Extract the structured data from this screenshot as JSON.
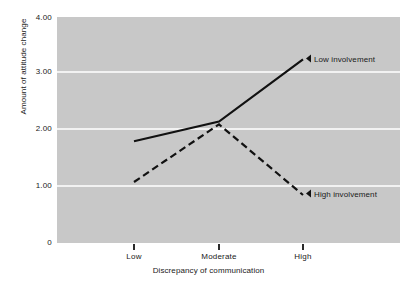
{
  "chart_data": {
    "type": "line",
    "title": "",
    "xlabel": "Discrepancy of communication",
    "ylabel": "Amount of attitude change",
    "categories": [
      "Low",
      "Moderate",
      "High"
    ],
    "ylim": [
      0,
      4
    ],
    "yticks": [
      0,
      1,
      2,
      3,
      4
    ],
    "ytick_labels": [
      "0",
      "1.00",
      "2.00",
      "3.00",
      "4.00"
    ],
    "grid": "horizontal gridlines at 1.00, 2.00, 3.00",
    "legend_position": "inline end-of-line annotations, right side",
    "background_color": "#c8c8c8",
    "gridline_color": "#f2f2f2",
    "line_color": "#111111",
    "series": [
      {
        "name": "Low involvement",
        "style": "solid",
        "values": [
          1.8,
          2.15,
          3.25
        ],
        "label_marker": "left-triangle"
      },
      {
        "name": "High involvement",
        "style": "dashed",
        "values": [
          1.08,
          2.1,
          0.85
        ],
        "label_marker": "left-triangle"
      }
    ]
  },
  "axes": {
    "y": {
      "title": "Amount of attitude change",
      "ticks": [
        {
          "label": "4.00"
        },
        {
          "label": "3.00"
        },
        {
          "label": "2.00"
        },
        {
          "label": "1.00"
        },
        {
          "label": "0"
        }
      ]
    },
    "x": {
      "title": "Discrepancy of communication",
      "ticks": [
        {
          "label": "Low"
        },
        {
          "label": "Moderate"
        },
        {
          "label": "High"
        }
      ]
    }
  },
  "annotations": [
    {
      "text": "Low involvement"
    },
    {
      "text": "High involvement"
    }
  ]
}
